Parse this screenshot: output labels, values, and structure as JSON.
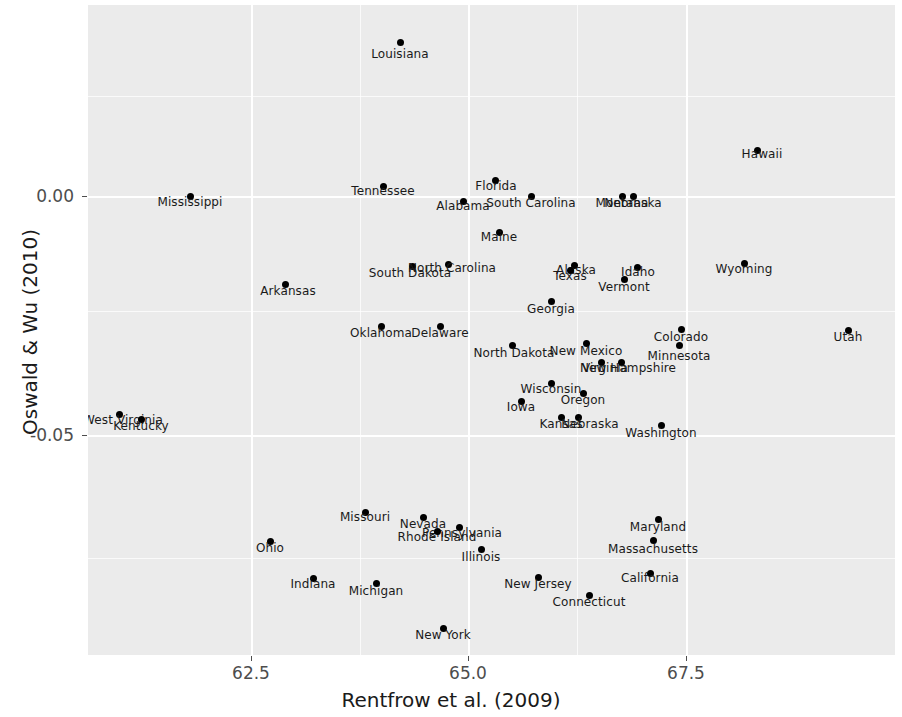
{
  "chart_data": {
    "type": "scatter",
    "title": "",
    "xlabel": "Rentfrow et al. (2009)",
    "ylabel": "Oswald & Wu (2010)",
    "xlim": [
      61.57,
      68.84
    ],
    "ylim": [
      -0.0735,
      0.0369
    ],
    "xticks": [
      62.5,
      65.0,
      67.5
    ],
    "xticklabels": [
      "62.5",
      "65.0",
      "67.5"
    ],
    "yticks": [
      0.0,
      -0.05
    ],
    "yticklabels": [
      "0.00",
      "-0.05"
    ],
    "x_minor_ticks": [
      63.75,
      66.25
    ],
    "y_minor_ticks": [
      0.025,
      -0.025
    ],
    "grid": true,
    "legend": false,
    "panel_background": "#ebebeb",
    "grid_color": "#ffffff",
    "point_color": "#000000",
    "label_color": "#1a1a1a",
    "point_label_field": "state",
    "points": [
      {
        "state": "Louisiana",
        "x": 64.38,
        "y": 0.0325,
        "px": 400,
        "py": 42,
        "lx": 400,
        "ly": 48
      },
      {
        "state": "Hawaii",
        "x": 67.59,
        "y": 0.0142,
        "px": 757,
        "py": 150,
        "lx": 762,
        "ly": 148
      },
      {
        "state": "Mississippi",
        "x": 62.29,
        "y": 0.0003,
        "px": 190,
        "py": 196,
        "lx": 190,
        "ly": 196
      },
      {
        "state": "Tennessee",
        "x": 63.99,
        "y": 0.0007,
        "px": 383,
        "py": 186,
        "lx": 383,
        "ly": 185
      },
      {
        "state": "Florida",
        "x": 64.99,
        "y": 0.002,
        "px": 495,
        "py": 180,
        "lx": 496,
        "ly": 180
      },
      {
        "state": "Alabama",
        "x": 64.84,
        "y": -0.0007,
        "px": 463,
        "py": 201,
        "lx": 463,
        "ly": 200
      },
      {
        "state": "South Carolina",
        "x": 65.29,
        "y": -0.0002,
        "px": 531,
        "py": 196,
        "lx": 531,
        "ly": 197
      },
      {
        "state": "Montana",
        "x": 66.26,
        "y": -0.0004,
        "px": 622,
        "py": 196,
        "lx": 622,
        "ly": 197
      },
      {
        "state": "Nebraska",
        "x": 66.37,
        "y": -0.0004,
        "px": 633,
        "py": 196,
        "lx": 633,
        "ly": 197
      },
      {
        "state": "Maine",
        "x": 65.03,
        "y": -0.004,
        "px": 499,
        "py": 232,
        "lx": 499,
        "ly": 231
      },
      {
        "state": "South Dakota",
        "x": 64.58,
        "y": -0.0075,
        "px": 412,
        "py": 266,
        "lx": 410,
        "ly": 267
      },
      {
        "state": "North Carolina",
        "x": 64.71,
        "y": -0.0074,
        "px": 448,
        "py": 264,
        "lx": 452,
        "ly": 262
      },
      {
        "state": "Alaska",
        "x": 66.0,
        "y": -0.0074,
        "px": 574,
        "py": 265,
        "lx": 576,
        "ly": 264
      },
      {
        "state": "Texas",
        "x": 65.93,
        "y": -0.0077,
        "px": 570,
        "py": 270,
        "lx": 570,
        "ly": 270
      },
      {
        "state": "Idaho",
        "x": 66.55,
        "y": -0.0075,
        "px": 637,
        "py": 267,
        "lx": 638,
        "ly": 266
      },
      {
        "state": "Vermont",
        "x": 66.43,
        "y": -0.0087,
        "px": 624,
        "py": 279,
        "lx": 624,
        "ly": 281
      },
      {
        "state": "Arkansas",
        "x": 62.86,
        "y": -0.0093,
        "px": 285,
        "py": 284,
        "lx": 288,
        "ly": 285
      },
      {
        "state": "Wyoming",
        "x": 67.44,
        "y": -0.0073,
        "px": 744,
        "py": 263,
        "lx": 744,
        "ly": 263
      },
      {
        "state": "Georgia",
        "x": 65.45,
        "y": -0.0108,
        "px": 551,
        "py": 301,
        "lx": 551,
        "ly": 303
      },
      {
        "state": "Oklahoma",
        "x": 64.1,
        "y": -0.0136,
        "px": 381,
        "py": 326,
        "lx": 381,
        "ly": 327
      },
      {
        "state": "Delaware",
        "x": 64.56,
        "y": -0.0136,
        "px": 440,
        "py": 326,
        "lx": 440,
        "ly": 327
      },
      {
        "state": "Colorado",
        "x": 66.82,
        "y": -0.0135,
        "px": 681,
        "py": 329,
        "lx": 681,
        "ly": 331
      },
      {
        "state": "Utah",
        "x": 68.56,
        "y": -0.0139,
        "px": 848,
        "py": 330,
        "lx": 848,
        "ly": 331
      },
      {
        "state": "North Dakota",
        "x": 65.03,
        "y": -0.0156,
        "px": 512,
        "py": 345,
        "lx": 514,
        "ly": 347
      },
      {
        "state": "New Mexico",
        "x": 65.73,
        "y": -0.0155,
        "px": 586,
        "py": 343,
        "lx": 586,
        "ly": 345
      },
      {
        "state": "Minnesota",
        "x": 66.77,
        "y": -0.0153,
        "px": 679,
        "py": 345,
        "lx": 679,
        "ly": 350
      },
      {
        "state": "Virginia",
        "x": 65.98,
        "y": -0.017,
        "px": 601,
        "py": 362,
        "lx": 605,
        "ly": 362
      },
      {
        "state": "New Hampshire",
        "x": 66.17,
        "y": -0.017,
        "px": 621,
        "py": 362,
        "lx": 628,
        "ly": 362
      },
      {
        "state": "Wisconsin",
        "x": 65.5,
        "y": -0.0195,
        "px": 551,
        "py": 383,
        "lx": 551,
        "ly": 383
      },
      {
        "state": "Oregon",
        "x": 65.81,
        "y": -0.0203,
        "px": 583,
        "py": 393,
        "lx": 583,
        "ly": 394
      },
      {
        "state": "Iowa",
        "x": 65.29,
        "y": -0.0207,
        "px": 521,
        "py": 401,
        "lx": 521,
        "ly": 401
      },
      {
        "state": "Kansas",
        "x": 65.62,
        "y": -0.0222,
        "px": 561,
        "py": 417,
        "lx": 561,
        "ly": 418
      },
      {
        "state": "Nebraska2",
        "x": 65.77,
        "y": -0.0222,
        "px": 578,
        "py": 417,
        "lx": 590,
        "ly": 418
      },
      {
        "state": "Washington",
        "x": 66.46,
        "y": -0.0227,
        "px": 661,
        "py": 425,
        "lx": 661,
        "ly": 427
      },
      {
        "state": "West Virginia",
        "x": 61.92,
        "y": -0.0219,
        "px": 119,
        "py": 414,
        "lx": 123,
        "ly": 414
      },
      {
        "state": "Kentucky",
        "x": 62.13,
        "y": -0.0224,
        "px": 141,
        "py": 419,
        "lx": 141,
        "ly": 420
      },
      {
        "state": "Missouri",
        "x": 64.04,
        "y": -0.0311,
        "px": 365,
        "py": 512,
        "lx": 365,
        "ly": 511
      },
      {
        "state": "Nevada",
        "x": 64.75,
        "y": -0.0318,
        "px": 423,
        "py": 517,
        "lx": 423,
        "ly": 518
      },
      {
        "state": "Pennsylvania",
        "x": 65.19,
        "y": -0.0327,
        "px": 459,
        "py": 527,
        "lx": 462,
        "ly": 527
      },
      {
        "state": "Rhode Island",
        "x": 64.97,
        "y": -0.033,
        "px": 437,
        "py": 531,
        "lx": 437,
        "ly": 531
      },
      {
        "state": "Maryland",
        "x": 66.62,
        "y": -0.0325,
        "px": 658,
        "py": 519,
        "lx": 658,
        "ly": 521
      },
      {
        "state": "Ohio",
        "x": 63.26,
        "y": -0.0342,
        "px": 270,
        "py": 541,
        "lx": 270,
        "ly": 542
      },
      {
        "state": "Massachusetts",
        "x": 66.46,
        "y": -0.0339,
        "px": 653,
        "py": 540,
        "lx": 653,
        "ly": 543
      },
      {
        "state": "Illinois",
        "x": 64.93,
        "y": -0.0348,
        "px": 481,
        "py": 549,
        "lx": 481,
        "ly": 551
      },
      {
        "state": "Indiana",
        "x": 63.47,
        "y": -0.0372,
        "px": 313,
        "py": 578,
        "lx": 313,
        "ly": 578
      },
      {
        "state": "Michigan",
        "x": 63.93,
        "y": -0.0377,
        "px": 376,
        "py": 583,
        "lx": 376,
        "ly": 585
      },
      {
        "state": "New Jersey",
        "x": 65.55,
        "y": -0.0372,
        "px": 538,
        "py": 577,
        "lx": 538,
        "ly": 578
      },
      {
        "state": "California",
        "x": 66.64,
        "y": -0.0369,
        "px": 650,
        "py": 573,
        "lx": 650,
        "ly": 572
      },
      {
        "state": "Connecticut",
        "x": 65.87,
        "y": -0.0382,
        "px": 589,
        "py": 595,
        "lx": 589,
        "ly": 596
      },
      {
        "state": "New York",
        "x": 64.7,
        "y": -0.0433,
        "px": 443,
        "py": 628,
        "lx": 443,
        "ly": 629
      }
    ]
  },
  "axes": {
    "x_title": "Rentfrow et al. (2009)",
    "y_title": "Oswald & Wu (2010)",
    "x_tick_labels": [
      "62.5",
      "65.0",
      "67.5"
    ],
    "y_tick_labels": [
      "0.00",
      "-0.05"
    ]
  }
}
